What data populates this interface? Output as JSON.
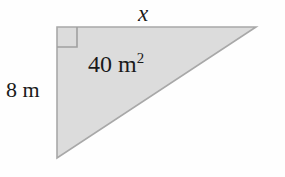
{
  "figure": {
    "shape": "right-triangle",
    "background_color": "#fefefe",
    "fill_color": "#dcdcdc",
    "stroke_color": "#a8a8a8",
    "text_color": "#1a1a1a",
    "labels": {
      "top_side": "x",
      "left_side": "8 m",
      "area_value": "40 m",
      "area_exponent": "2"
    },
    "right_angle_marker": {
      "name": "right-angle-square",
      "size_px": 20,
      "position": "top-left-vertex"
    },
    "geometry": {
      "top_left_vertex": "57,27",
      "top_right_vertex": "256,27",
      "bottom_left_vertex": "57,158"
    }
  }
}
